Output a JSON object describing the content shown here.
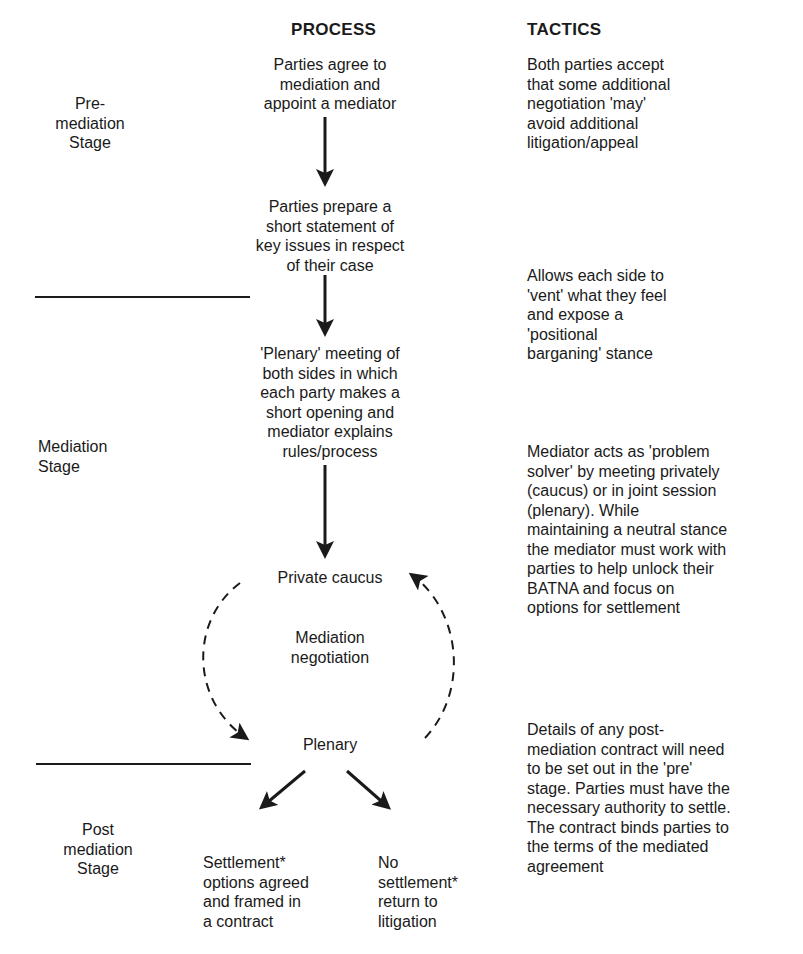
{
  "headers": {
    "process": "PROCESS",
    "tactics": "TACTICS"
  },
  "stages": [
    {
      "label_line1": "Pre-",
      "label_line2": "mediation",
      "label_line3": "Stage"
    },
    {
      "label_line1": "Mediation",
      "label_line2": "Stage"
    },
    {
      "label_line1": "Post",
      "label_line2": "mediation",
      "label_line3": "Stage"
    }
  ],
  "process": {
    "step1": {
      "l1": "Parties agree to",
      "l2": "mediation and",
      "l3": "appoint a mediator"
    },
    "step2": {
      "l1": "Parties prepare a",
      "l2": "short statement of",
      "l3": "key issues in respect",
      "l4": "of their case"
    },
    "step3": {
      "l1": "'Plenary' meeting of",
      "l2": "both sides in which",
      "l3": "each party makes a",
      "l4": "short opening and",
      "l5": "mediator explains",
      "l6": "rules/process"
    },
    "caucus": "Private caucus",
    "cycle_center": {
      "l1": "Mediation",
      "l2": "negotiation"
    },
    "plenary": "Plenary",
    "outcome_settlement": {
      "l1": "Settlement*",
      "l2": "options agreed",
      "l3": "and framed in",
      "l4": "a contract"
    },
    "outcome_no_settlement": {
      "l1": "No",
      "l2": "settlement*",
      "l3": "return to",
      "l4": "litigation"
    }
  },
  "tactics": {
    "t1": {
      "l1": "Both parties accept",
      "l2": "that some additional",
      "l3": "negotiation 'may'",
      "l4": "avoid additional",
      "l5": "litigation/appeal"
    },
    "t2": {
      "l1": "Allows each side to",
      "l2": "'vent' what they feel",
      "l3": "and expose a",
      "l4": "'positional",
      "l5": "barganing' stance"
    },
    "t3": {
      "l1": "Mediator acts as 'problem",
      "l2": "solver' by meeting privately",
      "l3": "(caucus) or in joint session",
      "l4": "(plenary). While",
      "l5": "maintaining a neutral stance",
      "l6": "the mediator must work with",
      "l7": "parties to help unlock their",
      "l8": "BATNA and focus on",
      "l9": "options for settlement"
    },
    "t4": {
      "l1": "Details of any post-",
      "l2": "mediation contract will need",
      "l3": "to be set out in the 'pre'",
      "l4": "stage. Parties must have the",
      "l5": "necessary authority to settle.",
      "l6": "The contract binds parties to",
      "l7": "the terms of the mediated",
      "l8": "agreement"
    }
  },
  "colors": {
    "ink": "#1a1a1a",
    "background": "#ffffff"
  }
}
